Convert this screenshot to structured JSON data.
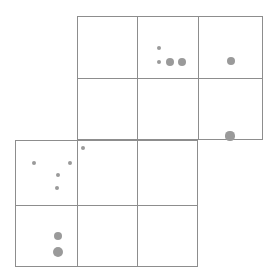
{
  "canvas": {
    "width": 276,
    "height": 277,
    "background": "#ffffff",
    "line_color": "#8d8d8d",
    "dot_color": "#9a9a9a"
  },
  "chart_data": {
    "type": "scatter",
    "title": "",
    "subtitle": "",
    "xlabel": "",
    "ylabel": "",
    "grid": true,
    "legend": null,
    "xlim": [
      0,
      276
    ],
    "ylim": [
      0,
      277
    ],
    "blocks": [
      {
        "name": "upper-block",
        "x": 77,
        "y": 16,
        "width": 186,
        "height": 124,
        "columns": 3,
        "rows": 2,
        "v_lines": [
          137,
          198
        ],
        "h_lines": [
          78
        ]
      },
      {
        "name": "lower-block",
        "x": 15,
        "y": 140,
        "width": 183,
        "height": 127,
        "columns": 3,
        "rows": 2,
        "v_lines": [
          77,
          137
        ],
        "h_lines": [
          205
        ]
      }
    ],
    "points": [
      {
        "id": "p1",
        "cell": "upper-r1c2",
        "x": 159,
        "y": 48,
        "r": 2.0
      },
      {
        "id": "p2",
        "cell": "upper-r1c2",
        "x": 159,
        "y": 62,
        "r": 2.0
      },
      {
        "id": "p3",
        "cell": "upper-r1c2",
        "x": 170,
        "y": 62,
        "r": 4.2
      },
      {
        "id": "p4",
        "cell": "upper-r1c2",
        "x": 182,
        "y": 62,
        "r": 4.2
      },
      {
        "id": "p5",
        "cell": "upper-r1c3",
        "x": 231,
        "y": 61,
        "r": 4.2
      },
      {
        "id": "p6",
        "cell": "upper-r2c3",
        "x": 230,
        "y": 136,
        "r": 4.6
      },
      {
        "id": "p7",
        "cell": "lower-r1c2",
        "x": 83,
        "y": 148,
        "r": 2.0
      },
      {
        "id": "p8",
        "cell": "lower-r1c1",
        "x": 34,
        "y": 163,
        "r": 2.1
      },
      {
        "id": "p9",
        "cell": "lower-r1c1",
        "x": 70,
        "y": 163,
        "r": 2.1
      },
      {
        "id": "p10",
        "cell": "lower-r1c1",
        "x": 58,
        "y": 175,
        "r": 2.3
      },
      {
        "id": "p11",
        "cell": "lower-r1c1",
        "x": 57,
        "y": 188,
        "r": 2.3
      },
      {
        "id": "p12",
        "cell": "lower-r2c1",
        "x": 58,
        "y": 236,
        "r": 4.4
      },
      {
        "id": "p13",
        "cell": "lower-r2c1",
        "x": 58,
        "y": 252,
        "r": 5.0
      }
    ],
    "cells": [
      {
        "id": "upper-r1c1",
        "x": 77,
        "y": 16,
        "width": 60,
        "height": 62,
        "point_count": 0
      },
      {
        "id": "upper-r1c2",
        "x": 137,
        "y": 16,
        "width": 61,
        "height": 62,
        "point_count": 4
      },
      {
        "id": "upper-r1c3",
        "x": 198,
        "y": 16,
        "width": 65,
        "height": 62,
        "point_count": 1
      },
      {
        "id": "upper-r2c1",
        "x": 77,
        "y": 78,
        "width": 60,
        "height": 62,
        "point_count": 0
      },
      {
        "id": "upper-r2c2",
        "x": 137,
        "y": 78,
        "width": 61,
        "height": 62,
        "point_count": 0
      },
      {
        "id": "upper-r2c3",
        "x": 198,
        "y": 78,
        "width": 65,
        "height": 62,
        "point_count": 1
      },
      {
        "id": "lower-r1c1",
        "x": 15,
        "y": 140,
        "width": 62,
        "height": 65,
        "point_count": 4
      },
      {
        "id": "lower-r1c2",
        "x": 77,
        "y": 140,
        "width": 60,
        "height": 65,
        "point_count": 1
      },
      {
        "id": "lower-r1c3",
        "x": 137,
        "y": 140,
        "width": 61,
        "height": 65,
        "point_count": 0
      },
      {
        "id": "lower-r2c1",
        "x": 15,
        "y": 205,
        "width": 62,
        "height": 62,
        "point_count": 2
      },
      {
        "id": "lower-r2c2",
        "x": 77,
        "y": 205,
        "width": 60,
        "height": 62,
        "point_count": 0
      },
      {
        "id": "lower-r2c3",
        "x": 137,
        "y": 205,
        "width": 61,
        "height": 62,
        "point_count": 0
      }
    ]
  }
}
